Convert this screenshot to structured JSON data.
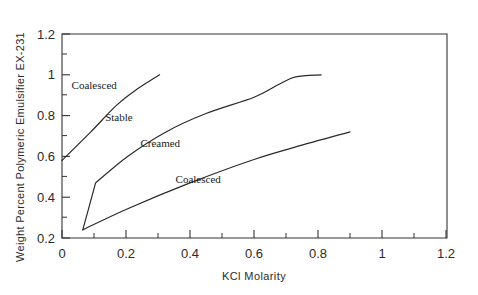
{
  "chart_data": {
    "type": "line",
    "title": "",
    "xlabel": "KCl Molarity",
    "ylabel": "Weight Percent Polymeric Emulsifier EX-231",
    "xlim": [
      0,
      1.2
    ],
    "ylim": [
      0.2,
      1.2
    ],
    "grid": false,
    "legend": "none",
    "x_ticks": [
      "0",
      "0.2",
      "0.4",
      "0.6",
      "0.8",
      "1",
      "1.2"
    ],
    "x_tick_values": [
      0,
      0.2,
      0.4,
      0.6,
      0.8,
      1.0,
      1.2
    ],
    "x_minor_ticks": [
      0.1,
      0.3,
      0.5,
      0.7,
      0.9,
      1.1
    ],
    "y_ticks": [
      "0.2",
      "0.4",
      "0.6",
      "0.8",
      "1",
      "1.2"
    ],
    "y_tick_values": [
      0.2,
      0.4,
      0.6,
      0.8,
      1.0,
      1.2
    ],
    "y_minor_ticks": [
      0.3,
      0.5,
      0.7,
      0.9,
      1.1
    ],
    "series": [
      {
        "name": "upper-boundary",
        "points": [
          [
            0.0,
            0.58
          ],
          [
            0.09,
            0.72
          ],
          [
            0.17,
            0.85
          ],
          [
            0.235,
            0.93
          ],
          [
            0.305,
            1.0
          ]
        ]
      },
      {
        "name": "middle-boundary",
        "points": [
          [
            0.065,
            0.24
          ],
          [
            0.105,
            0.47
          ],
          [
            0.205,
            0.6
          ],
          [
            0.325,
            0.72
          ],
          [
            0.45,
            0.81
          ],
          [
            0.6,
            0.89
          ],
          [
            0.68,
            0.955
          ],
          [
            0.73,
            0.99
          ],
          [
            0.81,
            1.0
          ]
        ]
      },
      {
        "name": "lower-boundary",
        "points": [
          [
            0.065,
            0.24
          ],
          [
            0.2,
            0.34
          ],
          [
            0.4,
            0.47
          ],
          [
            0.6,
            0.585
          ],
          [
            0.75,
            0.655
          ],
          [
            0.9,
            0.72
          ]
        ]
      }
    ],
    "annotations": [
      {
        "text": "Coalesced",
        "x": 0.03,
        "y": 0.93,
        "name": "region-label-coalesced-upper"
      },
      {
        "text": "Stable",
        "x": 0.135,
        "y": 0.775,
        "name": "region-label-stable"
      },
      {
        "text": "Creamed",
        "x": 0.245,
        "y": 0.645,
        "name": "region-label-creamed"
      },
      {
        "text": "Coalesced",
        "x": 0.355,
        "y": 0.47,
        "name": "region-label-coalesced-lower"
      }
    ]
  }
}
